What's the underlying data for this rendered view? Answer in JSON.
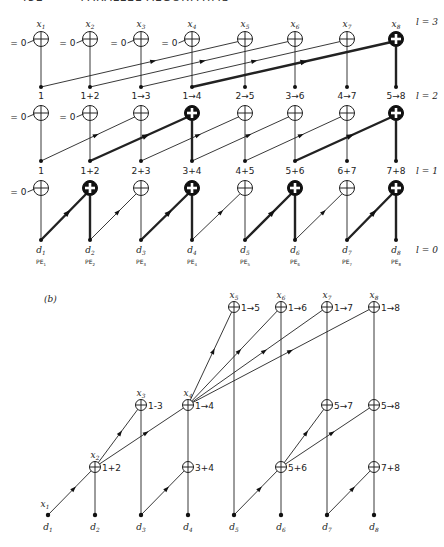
{
  "header": {
    "page": "452",
    "title": "PARALLEL ALGORITHMS"
  },
  "colors": {
    "ink": "#222222",
    "thin": "#333333",
    "thick": "#111111",
    "bg": "#ffffff"
  },
  "part_a": {
    "cols": [
      41,
      90,
      141,
      192,
      245,
      295,
      347,
      396
    ],
    "levels": [
      {
        "label": "l = 3",
        "node_y": 39,
        "dot_y": 87,
        "node_labels": [
          "x1",
          "x2",
          "x3",
          "x4",
          "x5",
          "x6",
          "x7",
          "x8"
        ],
        "zero_inputs": [
          0,
          1,
          2,
          3
        ],
        "dot_labels": [
          "1",
          "1+2",
          "1→3",
          "1→4",
          "2→5",
          "3→6",
          "4→7",
          "5→8"
        ],
        "dot_label_y": 99,
        "level_label": "l = 2",
        "bold_nodes": [
          7
        ],
        "bold_edges_from": [
          3
        ],
        "shift": 4
      },
      {
        "node_y": 113,
        "dot_y": 161,
        "zero_inputs": [
          0,
          1
        ],
        "dot_labels": [
          "1",
          "1+2",
          "2+3",
          "3+4",
          "4+5",
          "5+6",
          "6+7",
          "7+8"
        ],
        "dot_label_y": 174,
        "level_label": "l = 1",
        "bold_nodes": [
          3,
          7
        ],
        "bold_edges_from": [
          1,
          5
        ],
        "shift": 2
      },
      {
        "node_y": 188,
        "dot_y": 240,
        "zero_inputs": [
          0
        ],
        "dot_labels": [
          "d1",
          "d2",
          "d3",
          "d4",
          "d5",
          "d6",
          "d7",
          "d8"
        ],
        "dot_label_y": 253,
        "pe_labels": [
          "PE1",
          "PE2",
          "PE3",
          "PE4",
          "PE5",
          "PE6",
          "PE7",
          "PE8"
        ],
        "pe_label_y": 264,
        "level_label": "l = 0",
        "bold_nodes": [
          1,
          3,
          5,
          7
        ],
        "bold_edges_from": [
          0,
          2,
          4,
          6
        ],
        "shift": 1
      }
    ],
    "top_level_label": "l = 3",
    "zero_label": "= 0"
  },
  "part_b": {
    "label": "(b)",
    "cols": [
      48,
      95,
      141,
      188,
      234,
      281,
      327,
      374
    ],
    "dot_y": 515,
    "d_labels": [
      "d1",
      "d2",
      "d3",
      "d4",
      "d5",
      "d6",
      "d7",
      "d8"
    ],
    "nodes": [
      {
        "col": 1,
        "y": 467,
        "text": "1+2",
        "x_label": "x2"
      },
      {
        "col": 3,
        "y": 467,
        "text": "3+4"
      },
      {
        "col": 5,
        "y": 467,
        "text": "5+6"
      },
      {
        "col": 7,
        "y": 467,
        "text": "7+8"
      },
      {
        "col": 2,
        "y": 405,
        "text": "1-3",
        "x_label": "x3"
      },
      {
        "col": 3,
        "y": 405,
        "text": "1→4",
        "x_label": "x4"
      },
      {
        "col": 6,
        "y": 405,
        "text": "5→7"
      },
      {
        "col": 7,
        "y": 405,
        "text": "5→8"
      },
      {
        "col": 4,
        "y": 307,
        "text": "1→5",
        "x_label": "x5"
      },
      {
        "col": 5,
        "y": 307,
        "text": "1→6",
        "x_label": "x6"
      },
      {
        "col": 6,
        "y": 307,
        "text": "1→7",
        "x_label": "x7"
      },
      {
        "col": 7,
        "y": 307,
        "text": "1→8",
        "x_label": "x8"
      }
    ],
    "x1_label": "x1"
  }
}
